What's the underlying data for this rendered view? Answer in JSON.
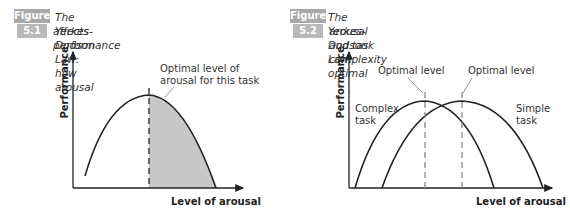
{
  "figures": [
    {
      "badge_label": "Figure",
      "badge_number": "5.1",
      "caption_line1": "The Yerkes-Dodson Law: how arousal",
      "caption_line2": "affects performance",
      "y_axis_label": "Performance",
      "x_axis_label": "Level of arousal",
      "annotation_line1": "Optimal level of",
      "annotation_line2": "arousal for this task"
    },
    {
      "badge_label": "Figure",
      "badge_number": "5.2",
      "caption_line1": "The Yerkes-Dodson Law: optimal",
      "caption_line2": "arousal and task complexity",
      "y_axis_label": "Performance",
      "x_axis_label": "Level of arousal",
      "annotation_left": "Optimal level",
      "annotation_right": "Optimal level",
      "curve_left_label_line1": "Complex",
      "curve_left_label_line2": "task",
      "curve_right_label_line1": "Simple",
      "curve_right_label_line2": "task"
    }
  ],
  "colors": {
    "badge": "#a9a9a9",
    "shade": "#c8c8c8",
    "curve": "#222222",
    "leader": "#999999"
  }
}
